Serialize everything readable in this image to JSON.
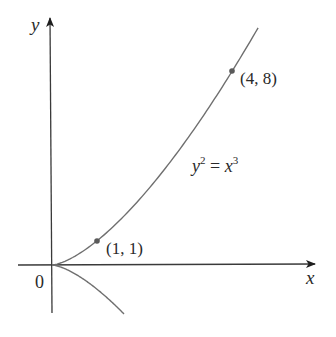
{
  "figure": {
    "title": "",
    "background": "#ffffff",
    "curve_color": "#6f6f6f",
    "axis_color": "#3a3a3a",
    "point_color": "#5a5a5a"
  },
  "axes": {
    "x_label": "x",
    "y_label": "y",
    "origin_label": "0"
  },
  "points": [
    {
      "x": 1,
      "y": 1,
      "label": "(1, 1)"
    },
    {
      "x": 4,
      "y": 8,
      "label": "(4, 8)"
    }
  ],
  "equation": {
    "lhs_var": "y",
    "lhs_exp": "2",
    "equals": "=",
    "rhs_var": "x",
    "rhs_exp": "3",
    "text": "y^2 = x^3"
  },
  "chart_data": {
    "type": "line",
    "title": "",
    "xlabel": "x",
    "ylabel": "y",
    "grid": false,
    "legend": null,
    "series": [
      {
        "name": "y = x^(3/2) (upper branch of y^2 = x^3)",
        "x": [
          0,
          0.5,
          1,
          2,
          3,
          4,
          4.58
        ],
        "y": [
          0,
          0.354,
          1,
          2.828,
          5.196,
          8,
          9.8
        ]
      },
      {
        "name": "y = -x^(3/2) (lower branch of y^2 = x^3)",
        "x": [
          0,
          0.5,
          1,
          1.6
        ],
        "y": [
          0,
          -0.354,
          -1,
          -2.02
        ]
      }
    ],
    "marked_points": [
      {
        "x": 1,
        "y": 1,
        "label": "(1, 1)"
      },
      {
        "x": 4,
        "y": 8,
        "label": "(4, 8)"
      }
    ],
    "annotations": [
      "y^2 = x^3",
      "(1, 1)",
      "(4, 8)",
      "0"
    ],
    "xlim": [
      -0.75,
      5.9
    ],
    "ylim": [
      -2.0,
      10.2
    ]
  }
}
